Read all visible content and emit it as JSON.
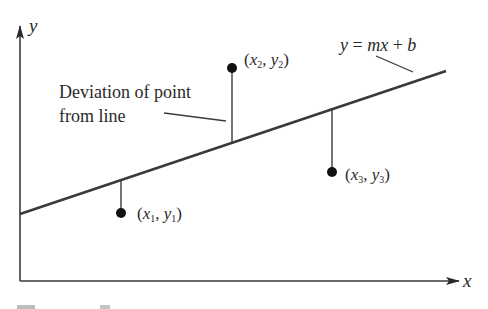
{
  "diagram": {
    "axes": {
      "x_label": "x",
      "y_label": "y"
    },
    "line": {
      "label": "y = mx + b",
      "label_parts": {
        "y": "y",
        "eq": " = ",
        "m": "m",
        "x": "x",
        "plus": " + ",
        "b": "b"
      }
    },
    "annotation": {
      "line1": "Deviation of point",
      "line2": "from line"
    },
    "points": [
      {
        "id": 1,
        "x_var": "x",
        "y_var": "y",
        "sub": "1",
        "open": "(",
        "comma": ", ",
        "close": ")"
      },
      {
        "id": 2,
        "x_var": "x",
        "y_var": "y",
        "sub": "2",
        "open": "(",
        "comma": ", ",
        "close": ")"
      },
      {
        "id": 3,
        "x_var": "x",
        "y_var": "y",
        "sub": "3",
        "open": "(",
        "comma": ", ",
        "close": ")"
      }
    ],
    "colors": {
      "ink": "#2a2a2a",
      "background": "#ffffff"
    }
  }
}
